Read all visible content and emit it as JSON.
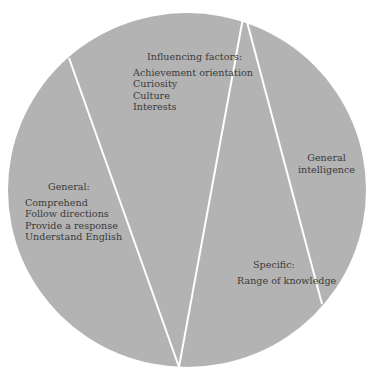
{
  "diagram": {
    "fill_color": "#b3b3b3",
    "divider_color": "#ffffff",
    "background": "#ffffff",
    "segments": [
      {
        "name": "influencing-factors",
        "heading": "Influencing factors:",
        "items": [
          "Achievement orientation",
          "Curiosity",
          "Culture",
          "Interests"
        ]
      },
      {
        "name": "general",
        "heading": "General:",
        "items": [
          "Comprehend",
          "Follow directions",
          "Provide a response",
          "Understand English"
        ]
      },
      {
        "name": "general-intelligence",
        "heading": "General",
        "items": [
          "intelligence"
        ]
      },
      {
        "name": "specific",
        "heading": "Specific:",
        "items": [
          "Range of knowledge"
        ]
      }
    ]
  }
}
